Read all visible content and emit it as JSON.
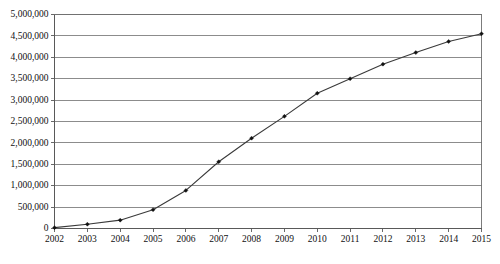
{
  "chart_data": {
    "type": "line",
    "title": "",
    "subtitle": "",
    "xlabel": "",
    "ylabel": "",
    "categories": [
      "2002",
      "2003",
      "2004",
      "2005",
      "2006",
      "2007",
      "2008",
      "2009",
      "2010",
      "2011",
      "2012",
      "2013",
      "2014",
      "2015"
    ],
    "series": [
      {
        "name": "",
        "values": [
          20000,
          100000,
          195000,
          440000,
          890000,
          1560000,
          2110000,
          2620000,
          3160000,
          3500000,
          3840000,
          4110000,
          4370000,
          4550000
        ]
      }
    ],
    "ylim": [
      0,
      5000000
    ],
    "ytick_values": [
      0,
      500000,
      1000000,
      1500000,
      2000000,
      2500000,
      3000000,
      3500000,
      4000000,
      4500000,
      5000000
    ],
    "ytick_labels": [
      "0",
      "500,000",
      "1,000,000",
      "1,500,000",
      "2,000,000",
      "2,500,000",
      "3,000,000",
      "3,500,000",
      "4,000,000",
      "4,500,000",
      "5,000,000"
    ],
    "grid": true,
    "grid_axis": "y",
    "legend": false,
    "legend_position": "none",
    "marker": "diamond",
    "line_color": "#3a3a3a",
    "marker_color": "#111111",
    "gridline_color": "#808080",
    "plot_background": "#ffffff",
    "border_color": "#6e6e6e"
  }
}
